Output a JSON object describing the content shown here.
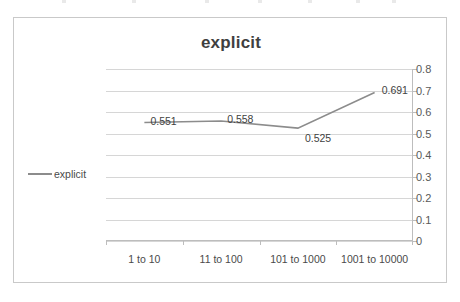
{
  "chart_data": {
    "type": "line",
    "title": "explicit",
    "xlabel": "",
    "ylabel": "",
    "categories": [
      "1 to 10",
      "11 to 100",
      "101 to 1000",
      "1001 to 10000"
    ],
    "series": [
      {
        "name": "explicit",
        "values": [
          0.551,
          0.558,
          0.525,
          0.691
        ],
        "color": "#8c8c8c"
      }
    ],
    "point_labels": [
      "0.551",
      "0.558",
      "0.525",
      "0.691"
    ],
    "ylim": [
      0,
      0.8
    ],
    "ytick_labels": [
      "0.8",
      "0.7",
      "0.6",
      "0.5",
      "0.4",
      "0.3",
      "0.2",
      "0.1",
      "0"
    ],
    "ytick_values": [
      0.8,
      0.7,
      0.6,
      0.5,
      0.4,
      0.3,
      0.2,
      0.1,
      0
    ],
    "y_axis_position": "right",
    "grid": true,
    "legend": {
      "position": "left",
      "entries": [
        "explicit"
      ]
    },
    "line_color": "#8c8c8c",
    "grid_color": "#d6d6d6",
    "title_color": "#3f3f3f"
  }
}
